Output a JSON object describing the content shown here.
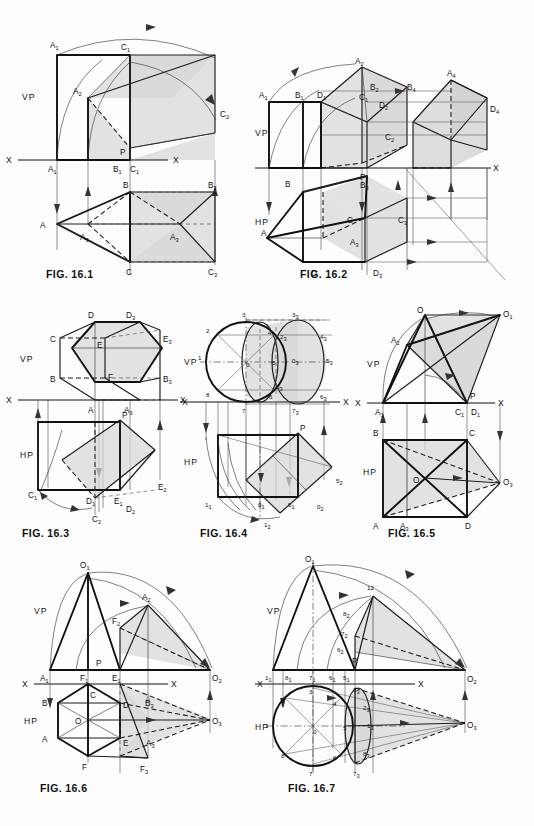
{
  "page": {
    "width": 534,
    "height": 826,
    "background": "#fdfdfd",
    "ink": "#111111",
    "shade_color": "#d7d7d7"
  },
  "figures": [
    {
      "id": "fig-16-1",
      "caption": "FIG. 16.1",
      "planes": [
        "VP",
        "HP"
      ],
      "reference_line": "X",
      "labels": [
        "A1",
        "C1",
        "A2",
        "C2",
        "P",
        "A1",
        "B1",
        "C1",
        "B3",
        "B",
        "A",
        "A3",
        "A3",
        "C",
        "C3"
      ]
    },
    {
      "id": "fig-16-2",
      "caption": "FIG. 16.2",
      "planes": [
        "VP",
        "HP"
      ],
      "reference_line": "X",
      "labels": [
        "A2",
        "A4",
        "A1",
        "B1",
        "D1",
        "C1",
        "B2",
        "B4",
        "D2",
        "D4",
        "C2",
        "P",
        "X",
        "B",
        "P",
        "B3",
        "B4",
        "B",
        "C",
        "C3",
        "A3",
        "A",
        "D",
        "D3",
        "D4"
      ]
    },
    {
      "id": "fig-16-3",
      "caption": "FIG. 16.3",
      "planes": [
        "VP",
        "HP"
      ],
      "reference_line": "X",
      "labels": [
        "D",
        "D3",
        "C",
        "E",
        "E3",
        "B",
        "F",
        "B3",
        "A",
        "A3",
        "P",
        "C1",
        "D1",
        "E1",
        "E2",
        "D2",
        "C2"
      ]
    },
    {
      "id": "fig-16-4",
      "caption": "FIG. 16.4",
      "planes": [
        "VP",
        "HP"
      ],
      "reference_line": "X",
      "labels": [
        "3",
        "33",
        "2",
        "4",
        "23",
        "43",
        "1",
        "0",
        "5",
        "03",
        "53",
        "8",
        "7",
        "6",
        "83",
        "63",
        "73",
        "P",
        "11",
        "01",
        "51",
        "52",
        "02",
        "12"
      ]
    },
    {
      "id": "fig-16-5",
      "caption": "FIG. 16.5",
      "planes": [
        "VP",
        "HP"
      ],
      "reference_line": "X",
      "labels": [
        "O",
        "O1",
        "A2",
        "P",
        "A1",
        "C1",
        "D1",
        "B",
        "C",
        "O",
        "O3",
        "A",
        "A3",
        "D"
      ]
    },
    {
      "id": "fig-16-6",
      "caption": "FIG. 16.6",
      "planes": [
        "VP",
        "HP"
      ],
      "reference_line": "X",
      "labels": [
        "O1",
        "A2",
        "F2",
        "P",
        "A1",
        "F1",
        "E1",
        "O2",
        "C",
        "B",
        "D",
        "B3",
        "O",
        "A",
        "E",
        "A3",
        "O3",
        "F",
        "F3"
      ]
    },
    {
      "id": "fig-16-7",
      "caption": "FIG. 16.7",
      "planes": [
        "VP",
        "HP"
      ],
      "reference_line": "X",
      "labels": [
        "O1",
        "12",
        "82",
        "72",
        "62",
        "P",
        "11",
        "81",
        "71",
        "61",
        "51",
        "O2",
        "3",
        "33",
        "2",
        "4",
        "23",
        "1",
        "0",
        "5",
        "13",
        "O3",
        "8",
        "7",
        "6",
        "83",
        "73"
      ]
    }
  ],
  "captions": {
    "f1": "FIG. 16.1",
    "f2": "FIG. 16.2",
    "f3": "FIG. 16.3",
    "f4": "FIG. 16.4",
    "f5": "FIG. 16.5",
    "f6": "FIG. 16.6",
    "f7": "FIG. 16.7"
  },
  "text": {
    "vp": "VP",
    "hp": "HP",
    "x": "X",
    "p": "P",
    "o": "O",
    "a": "A",
    "b": "B",
    "c": "C",
    "d": "D",
    "e": "E",
    "f": "F",
    "n0": "0",
    "n1": "1",
    "n2": "2",
    "n3": "3",
    "n4": "4",
    "n5": "5",
    "n6": "6",
    "n7": "7",
    "n8": "8",
    "n12": "12",
    "s1": "1",
    "s2": "2",
    "s3": "3",
    "s4": "4"
  }
}
